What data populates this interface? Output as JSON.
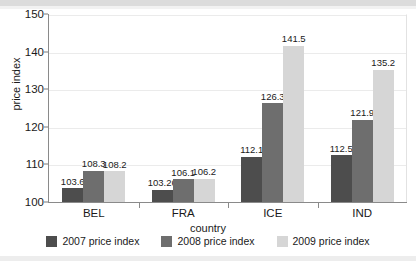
{
  "chart_data": {
    "type": "bar",
    "title": "",
    "subtitle": "",
    "xlabel": "country",
    "ylabel": "price index",
    "categories": [
      "BEL",
      "FRA",
      "ICE",
      "IND"
    ],
    "series": [
      {
        "name": "2007 price index",
        "color": "#4d4d4d",
        "values": [
          103.6,
          103.26,
          112.1,
          112.5
        ],
        "labels": [
          "103.6",
          "103.26",
          "112.1",
          "112.5"
        ]
      },
      {
        "name": "2008 price index",
        "color": "#6e6e6e",
        "values": [
          108.3,
          106.1,
          126.3,
          121.9
        ],
        "labels": [
          "108.3",
          "106.1",
          "126.3",
          "121.9"
        ]
      },
      {
        "name": "2009 price index",
        "color": "#d6d6d6",
        "values": [
          108.2,
          106.2,
          141.5,
          135.2
        ],
        "labels": [
          "108.2",
          "106.2",
          "141.5",
          "135.2"
        ]
      }
    ],
    "ylim": [
      100,
      150
    ],
    "yticks": [
      100,
      110,
      120,
      130,
      140,
      150
    ],
    "ytick_labels": [
      "100",
      "110",
      "120",
      "130",
      "140",
      "150"
    ],
    "grid": true,
    "grid_axis": "y",
    "legend_position": "bottom"
  },
  "legend": {
    "items": [
      {
        "label": "2007 price index",
        "color": "#4d4d4d"
      },
      {
        "label": "2008 price index",
        "color": "#6e6e6e"
      },
      {
        "label": "2009 price index",
        "color": "#d6d6d6"
      }
    ]
  }
}
